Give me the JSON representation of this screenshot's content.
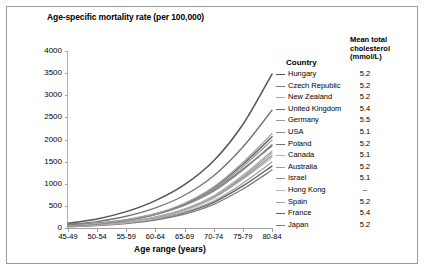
{
  "chart_data": {
    "type": "line",
    "title": "",
    "ylabel": "Age-specific mortality rate (per 100,000)",
    "xlabel": "Age range (years)",
    "categories": [
      "45-49",
      "50-54",
      "55-59",
      "60-64",
      "65-69",
      "70-74",
      "75-79",
      "80-84"
    ],
    "ylim": [
      0,
      4000
    ],
    "yticks": [
      0,
      500,
      1000,
      1500,
      2000,
      2500,
      3000,
      3500,
      4000
    ],
    "grid": false,
    "legend_position": "right",
    "legend_title_country": "Country",
    "legend_title_value": "Mean total cholesterol (mmol/L)",
    "series": [
      {
        "name": "Hungary",
        "cholesterol": "5.2",
        "color": "#555555",
        "width": 1.5,
        "values": [
          110,
          205,
          370,
          620,
          980,
          1520,
          2340,
          3480
        ]
      },
      {
        "name": "Czech Republic",
        "cholesterol": "5.2",
        "color": "#777777",
        "width": 1.4,
        "values": [
          80,
          145,
          265,
          455,
          740,
          1180,
          1830,
          2660
        ]
      },
      {
        "name": "New Zealand",
        "cholesterol": "5.2",
        "color": "#a8a8a8",
        "width": 1.3,
        "values": [
          55,
          100,
          185,
          325,
          560,
          930,
          1480,
          2130
        ]
      },
      {
        "name": "United Kingdom",
        "cholesterol": "5.4",
        "color": "#6d6d6d",
        "width": 1.5,
        "values": [
          50,
          95,
          175,
          315,
          545,
          905,
          1440,
          2060
        ]
      },
      {
        "name": "Germany",
        "cholesterol": "5.5",
        "color": "#999999",
        "width": 1.3,
        "values": [
          48,
          90,
          168,
          300,
          520,
          870,
          1390,
          1980
        ]
      },
      {
        "name": "USA",
        "cholesterol": "5.1",
        "color": "#8a8a8a",
        "width": 1.3,
        "values": [
          60,
          105,
          180,
          305,
          510,
          830,
          1310,
          1890
        ]
      },
      {
        "name": "Poland",
        "cholesterol": "5.2",
        "color": "#707070",
        "width": 1.4,
        "values": [
          58,
          108,
          190,
          320,
          530,
          850,
          1330,
          1860
        ]
      },
      {
        "name": "Canada",
        "cholesterol": "5.1",
        "color": "#b0b0b0",
        "width": 1.2,
        "values": [
          40,
          76,
          140,
          250,
          435,
          730,
          1190,
          1740
        ]
      },
      {
        "name": "Australia",
        "cholesterol": "5.2",
        "color": "#9e9e9e",
        "width": 1.2,
        "values": [
          38,
          72,
          134,
          240,
          420,
          710,
          1160,
          1700
        ]
      },
      {
        "name": "Israel",
        "cholesterol": "5.1",
        "color": "#8f8f8f",
        "width": 1.2,
        "values": [
          42,
          78,
          140,
          245,
          420,
          700,
          1130,
          1640
        ]
      },
      {
        "name": "Hong Kong",
        "cholesterol": "–",
        "color": "#bbbbbb",
        "width": 1.2,
        "values": [
          35,
          66,
          122,
          222,
          395,
          670,
          1100,
          1590
        ]
      },
      {
        "name": "Spain",
        "cholesterol": "5.2",
        "color": "#a0a0a0",
        "width": 1.2,
        "values": [
          33,
          62,
          115,
          205,
          360,
          610,
          1010,
          1490
        ]
      },
      {
        "name": "France",
        "cholesterol": "5.4",
        "color": "#606060",
        "width": 1.4,
        "values": [
          36,
          66,
          118,
          205,
          350,
          580,
          950,
          1400
        ]
      },
      {
        "name": "Japan",
        "cholesterol": "5.2",
        "color": "#7d7d7d",
        "width": 1.3,
        "values": [
          30,
          56,
          102,
          180,
          315,
          535,
          880,
          1310
        ]
      }
    ]
  }
}
